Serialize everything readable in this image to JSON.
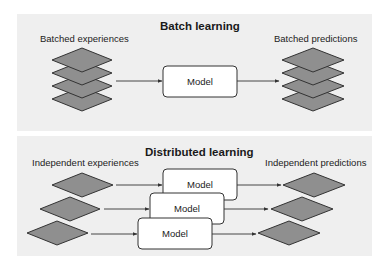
{
  "batch": {
    "title": "Batch learning",
    "input_label": "Batched experiences",
    "output_label": "Batched predictions",
    "model_label": "Model",
    "stack_count": 4
  },
  "distributed": {
    "title": "Distributed learning",
    "input_label": "Independent experiences",
    "output_label": "Independent predictions",
    "models": [
      {
        "label": "Model"
      },
      {
        "label": "Model"
      },
      {
        "label": "Model"
      }
    ]
  },
  "colors": {
    "panel_bg": "#efefef",
    "diamond_fill": "#8f8f8f",
    "diamond_stroke": "#333333",
    "box_fill": "#ffffff",
    "line": "#333333"
  }
}
